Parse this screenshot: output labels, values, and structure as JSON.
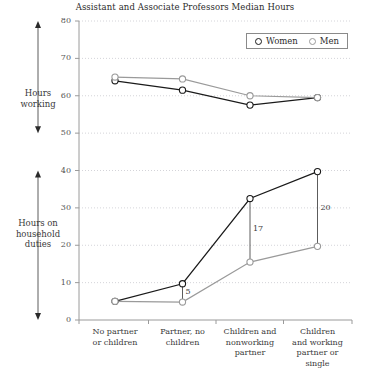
{
  "chart_data": {
    "type": "line",
    "title": "Assistant and Associate Professors Median Hours",
    "xlabel": "",
    "ylabel": "",
    "ylim": [
      0,
      80
    ],
    "yticks": [
      0,
      10,
      20,
      30,
      40,
      50,
      60,
      70,
      80
    ],
    "grid": true,
    "legend_position": "top-right",
    "categories": [
      "No partner or children",
      "Partner, no children",
      "Children and nonworking partner",
      "Children and working partner or single"
    ],
    "category_lines": [
      [
        "No partner",
        "or children"
      ],
      [
        "Partner, no",
        "children"
      ],
      [
        "Children and",
        "nonworking",
        "partner"
      ],
      [
        "Children",
        "and working",
        "partner or",
        "single"
      ]
    ],
    "panels": [
      {
        "name": "Hours working",
        "label_lines": [
          "Hours",
          "working"
        ],
        "range": [
          50,
          80
        ]
      },
      {
        "name": "Hours on household duties",
        "label_lines": [
          "Hours on",
          "household",
          "duties"
        ],
        "range": [
          0,
          40
        ]
      }
    ],
    "series": [
      {
        "name": "Women",
        "color": "#1a1a1a",
        "working_hours": [
          64.0,
          61.5,
          57.5,
          59.5
        ],
        "household_hours": [
          5.0,
          9.7,
          32.5,
          39.7
        ]
      },
      {
        "name": "Men",
        "color": "#9a9a9a",
        "working_hours": [
          65.0,
          64.5,
          60.0,
          59.5
        ],
        "household_hours": [
          5.0,
          4.8,
          15.5,
          19.7
        ]
      }
    ],
    "annotations": [
      {
        "label": "5",
        "category_index": 1,
        "gap": 5
      },
      {
        "label": "17",
        "category_index": 2,
        "gap": 17
      },
      {
        "label": "20",
        "category_index": 3,
        "gap": 20
      }
    ],
    "legend_entries": [
      "Women",
      "Men"
    ]
  }
}
